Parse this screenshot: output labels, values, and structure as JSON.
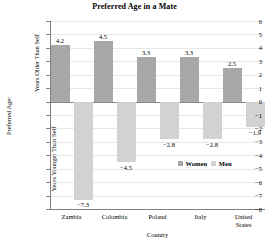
{
  "chart_data": {
    "type": "bar",
    "title": "Preferred Age in a Mate",
    "xlabel": "Country",
    "ylabel": "Preferred Age:",
    "ylabel_upper": "Years Older Than Self",
    "ylabel_lower": "Years Younger Than Self",
    "categories": [
      "Zambia",
      "Colombia",
      "Poland",
      "Italy",
      "United States"
    ],
    "category_lines": [
      [
        "Zambia"
      ],
      [
        "Colombia"
      ],
      [
        "Poland"
      ],
      [
        "Italy"
      ],
      [
        "United",
        "States"
      ]
    ],
    "series": [
      {
        "name": "Women",
        "color": "#a8a8a8",
        "values": [
          4.2,
          4.5,
          3.3,
          3.3,
          2.5
        ]
      },
      {
        "name": "Men",
        "color": "#d2d2d2",
        "values": [
          -7.3,
          -4.5,
          -2.8,
          -2.8,
          -1.9
        ]
      }
    ],
    "value_labels": {
      "women": [
        "4.2",
        "4.5",
        "3.3",
        "3.3",
        "2.5"
      ],
      "men": [
        "−7.3",
        "−4.5",
        "−2.8",
        "−2.8",
        "−1.9"
      ]
    },
    "ylim": [
      -8,
      6
    ],
    "ytick_values": [
      6,
      5,
      4,
      3,
      2,
      1,
      0,
      -1,
      -2,
      -3,
      -4,
      -5,
      -6,
      -7,
      -8
    ],
    "ytick_labels": [
      "6",
      "5",
      "4",
      "3",
      "2",
      "1",
      "0",
      "−1",
      "−2",
      "−3",
      "−4",
      "−5",
      "−6",
      "−7",
      "−8"
    ],
    "grid": true,
    "legend_position": "inside-lower-right",
    "legend": [
      "Women",
      "Men"
    ]
  }
}
